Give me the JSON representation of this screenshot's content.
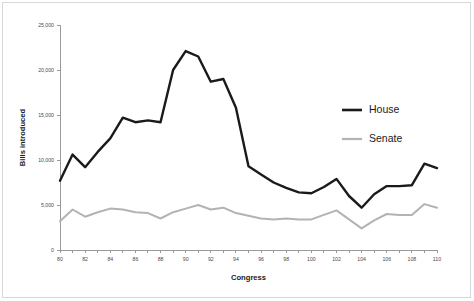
{
  "chart_data": {
    "type": "line",
    "title": "",
    "xlabel": "Congress",
    "ylabel": "Bills introduced",
    "xlim": [
      80,
      110
    ],
    "ylim": [
      0,
      25000
    ],
    "x_tick_labels": [
      "80",
      "82",
      "84",
      "86",
      "88",
      "90",
      "92",
      "94",
      "96",
      "98",
      "100",
      "102",
      "104",
      "106",
      "108",
      "110"
    ],
    "x_tick_values": [
      80,
      82,
      84,
      86,
      88,
      90,
      92,
      94,
      96,
      98,
      100,
      102,
      104,
      106,
      108,
      110
    ],
    "y_tick_labels": [
      "0",
      "5,000",
      "10,000",
      "15,000",
      "20,000",
      "25,000"
    ],
    "y_tick_values": [
      0,
      5000,
      10000,
      15000,
      20000,
      25000
    ],
    "grid": false,
    "legend_position": "right-middle",
    "x": [
      80,
      81,
      82,
      83,
      84,
      85,
      86,
      87,
      88,
      89,
      90,
      91,
      92,
      93,
      94,
      95,
      96,
      97,
      98,
      99,
      100,
      101,
      102,
      103,
      104,
      105,
      106,
      107,
      108,
      109,
      110
    ],
    "series": [
      {
        "name": "House",
        "color": "#1a1a1a",
        "width": 2.4,
        "values": [
          7700,
          10600,
          9200,
          10900,
          12400,
          14700,
          14200,
          14400,
          14200,
          20000,
          22100,
          21500,
          18700,
          19000,
          15800,
          9300,
          8400,
          7500,
          6900,
          6400,
          6300,
          7000,
          7900,
          6000,
          4700,
          6200,
          7100,
          7100,
          7200,
          9600,
          9100
        ]
      },
      {
        "name": "Senate",
        "color": "#b3b3b3",
        "width": 2.0,
        "values": [
          3200,
          4500,
          3700,
          4200,
          4600,
          4500,
          4200,
          4100,
          3500,
          4200,
          4600,
          5000,
          4500,
          4700,
          4100,
          3800,
          3500,
          3400,
          3500,
          3400,
          3400,
          3900,
          4400,
          3400,
          2400,
          3300,
          4000,
          3900,
          3900,
          5100,
          4700
        ]
      }
    ]
  },
  "legend": {
    "entries": [
      {
        "label": "House",
        "color": "#1a1a1a"
      },
      {
        "label": "Senate",
        "color": "#b3b3b3"
      }
    ]
  },
  "axes": {
    "x_title": "Congress",
    "y_title": "Bills introduced"
  }
}
